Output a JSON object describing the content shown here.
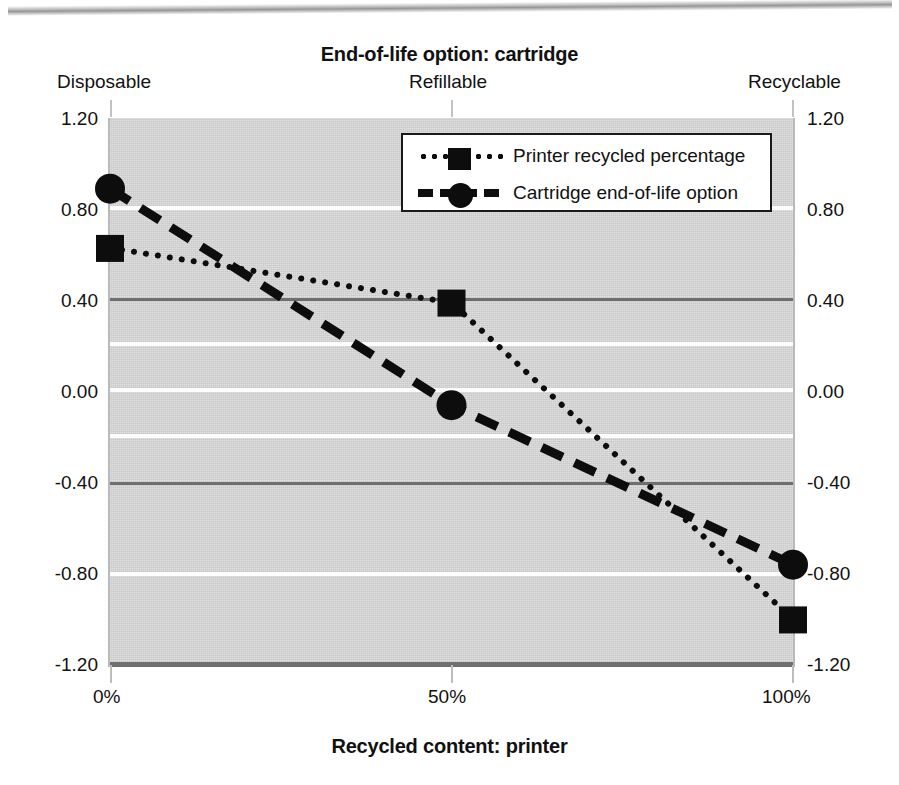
{
  "chart_data": {
    "type": "line",
    "title": "End-of-life option: cartridge",
    "xlabel": "Recycled content: printer",
    "ylabel": "",
    "x": [
      0,
      50,
      100
    ],
    "categories": [
      "0%",
      "50%",
      "100%"
    ],
    "top_categories": [
      "Disposable",
      "Refillable",
      "Recyclable"
    ],
    "series": [
      {
        "name": "Printer recycled percentage",
        "marker": "square",
        "linestyle": "dotted",
        "values": [
          0.63,
          0.39,
          -1.0
        ]
      },
      {
        "name": "Cartridge end-of-life option",
        "marker": "circle",
        "linestyle": "dashed",
        "values": [
          0.89,
          -0.06,
          -0.76
        ]
      }
    ],
    "ylim": [
      -1.2,
      1.2
    ],
    "xlim": [
      0,
      100
    ],
    "ytick_labels_left": [
      "1.20",
      "0.80",
      "0.40",
      "0.00",
      "-0.40",
      "-0.80",
      "-1.20"
    ],
    "ytick_labels_right": [
      "1.20",
      "0.80",
      "0.40",
      "0.00",
      "-0.40",
      "-0.80",
      "-1.20"
    ],
    "ytick_values": [
      1.2,
      0.8,
      0.4,
      0.0,
      -0.4,
      -0.8,
      -1.2
    ],
    "xtick_labels": [
      "0%",
      "50%",
      "100%"
    ],
    "grid": true,
    "legend_position": "upper center",
    "plot_background_color": "#d7d7d7",
    "grid_dark_color": "#6f6f6f",
    "grid_light_color": "#fdfdfd",
    "series_color": "#0d0d0d"
  },
  "chart": {
    "title": "End-of-life option: cartridge",
    "xaxis_title": "Recycled content: printer",
    "top_labels": [
      "Disposable",
      "Refillable",
      "Recyclable"
    ],
    "y_ticks_left": [
      "1.20",
      "0.80",
      "0.40",
      "0.00",
      "-0.40",
      "-0.80",
      "-1.20"
    ],
    "y_ticks_right": [
      "1.20",
      "0.80",
      "0.40",
      "0.00",
      "-0.40",
      "-0.80",
      "-1.20"
    ],
    "x_ticks": [
      "0%",
      "50%",
      "100%"
    ],
    "legend": {
      "items": [
        {
          "label": "Printer recycled percentage",
          "marker": "square-marker",
          "line": "dotted-line"
        },
        {
          "label": "Cartridge end-of-life option",
          "marker": "circle-marker",
          "line": "dashed-line"
        }
      ]
    }
  }
}
